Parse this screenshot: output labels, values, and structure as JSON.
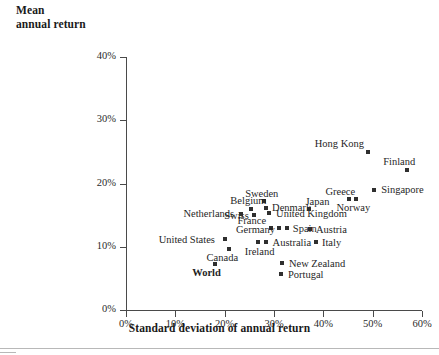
{
  "chart_data": {
    "type": "scatter",
    "title": "",
    "ylabel_line1": "Mean",
    "ylabel_line2": "annual return",
    "xlabel": "Standard deviation of annual return",
    "xlim": [
      0,
      60
    ],
    "ylim": [
      0,
      40
    ],
    "xticks": [
      "0%",
      "10%",
      "20%",
      "30%",
      "40%",
      "50%",
      "60%"
    ],
    "yticks": [
      "0%",
      "10%",
      "20%",
      "30%",
      "40%"
    ],
    "xtick_values": [
      0,
      10,
      20,
      30,
      40,
      50,
      60
    ],
    "ytick_values": [
      0,
      10,
      20,
      30,
      40
    ],
    "grid": false,
    "legend": "none",
    "marker_color": "#2f2f2f",
    "axis_color": "#4a4a4a",
    "points": [
      {
        "name": "Hong Kong",
        "x": 49.0,
        "y": 25.0,
        "label_dx": -53,
        "label_dy": -14,
        "bold": false
      },
      {
        "name": "Finland",
        "x": 57.0,
        "y": 22.2,
        "label_dx": -24,
        "label_dy": -14,
        "bold": false
      },
      {
        "name": "Singapore",
        "x": 50.3,
        "y": 19.0,
        "label_dx": 7,
        "label_dy": -6,
        "bold": false
      },
      {
        "name": "Greece",
        "x": 45.3,
        "y": 17.5,
        "label_dx": -24,
        "label_dy": -13,
        "bold": false
      },
      {
        "name": "Norway",
        "x": 46.7,
        "y": 17.5,
        "label_dx": -20,
        "label_dy": 3,
        "bold": false
      },
      {
        "name": "Sweden",
        "x": 28.0,
        "y": 17.3,
        "label_dx": -19,
        "label_dy": -13,
        "bold": false
      },
      {
        "name": "Denmark",
        "x": 28.4,
        "y": 16.1,
        "label_dx": 6,
        "label_dy": -6,
        "bold": false
      },
      {
        "name": "United Kingdom",
        "x": 29.0,
        "y": 15.3,
        "label_dx": 7,
        "label_dy": -5,
        "bold": false
      },
      {
        "name": "Belgium",
        "x": 25.4,
        "y": 16.0,
        "label_dx": -21,
        "label_dy": -14,
        "bold": false
      },
      {
        "name": "Swiss",
        "x": 26.0,
        "y": 15.0,
        "label_dx": -30,
        "label_dy": -5,
        "bold": false
      },
      {
        "name": "Netherlands",
        "x": 23.4,
        "y": 15.1,
        "label_dx": -58,
        "label_dy": -6,
        "bold": false
      },
      {
        "name": "Japan",
        "x": 37.0,
        "y": 15.9,
        "label_dx": -3,
        "label_dy": -13,
        "bold": false
      },
      {
        "name": "France",
        "x": 29.3,
        "y": 13.0,
        "label_dx": -33,
        "label_dy": -13,
        "bold": false
      },
      {
        "name": "Germany",
        "x": 31.0,
        "y": 12.9,
        "label_dx": -43,
        "label_dy": -4,
        "bold": false
      },
      {
        "name": "Spain",
        "x": 32.6,
        "y": 13.0,
        "label_dx": 6,
        "label_dy": -5,
        "bold": false
      },
      {
        "name": "Austria",
        "x": 37.3,
        "y": 12.8,
        "label_dx": 6,
        "label_dy": -5,
        "bold": false
      },
      {
        "name": "Italy",
        "x": 38.5,
        "y": 10.7,
        "label_dx": 6,
        "label_dy": -5,
        "bold": false
      },
      {
        "name": "United States",
        "x": 20.0,
        "y": 11.3,
        "label_dx": -66,
        "label_dy": -5,
        "bold": false
      },
      {
        "name": "Australia",
        "x": 28.3,
        "y": 10.8,
        "label_dx": 7,
        "label_dy": -5,
        "bold": false
      },
      {
        "name": "Ireland",
        "x": 26.7,
        "y": 10.7,
        "label_dx": -13,
        "label_dy": 4,
        "bold": false
      },
      {
        "name": "Canada",
        "x": 20.8,
        "y": 9.7,
        "label_dx": -22,
        "label_dy": 3,
        "bold": false
      },
      {
        "name": "New Zealand",
        "x": 31.6,
        "y": 7.5,
        "label_dx": 7,
        "label_dy": -5,
        "bold": false
      },
      {
        "name": "Portugal",
        "x": 31.4,
        "y": 5.7,
        "label_dx": 7,
        "label_dy": -5,
        "bold": false
      },
      {
        "name": "World",
        "x": 18.1,
        "y": 7.3,
        "label_dx": -23,
        "label_dy": 3,
        "bold": true
      }
    ]
  }
}
